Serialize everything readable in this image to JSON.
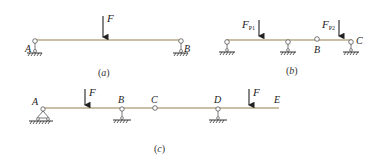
{
  "colors": {
    "beam": "#b8a98a",
    "ink": "#222222",
    "background": "#ffffff"
  },
  "diagram_a": {
    "caption": "(a)",
    "labels": {
      "A": "A",
      "B": "B",
      "F": "F"
    }
  },
  "diagram_b": {
    "caption": "(b)",
    "labels": {
      "B": "B",
      "C": "C",
      "F1": "F",
      "F1_sub": "P1",
      "F2": "F",
      "F2_sub": "P2"
    }
  },
  "diagram_c": {
    "caption": "(c)",
    "labels": {
      "A": "A",
      "B": "B",
      "C": "C",
      "D": "D",
      "E": "E",
      "F1": "F",
      "F2": "F"
    }
  }
}
